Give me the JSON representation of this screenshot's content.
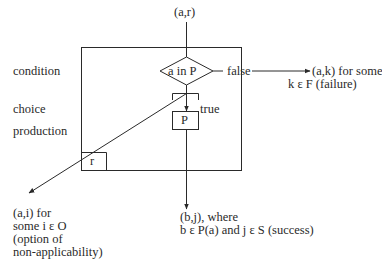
{
  "diagram": {
    "type": "flowchart",
    "input": "(a,r)",
    "row_labels": {
      "condition": "condition",
      "choice": "choice",
      "production": "production"
    },
    "condition_node": {
      "shape": "diamond",
      "label": "a in P"
    },
    "false_branch": {
      "edge_label": "false",
      "target_line1": "(a,k) for some",
      "target_line2": "k ε F (failure)"
    },
    "true_branch": {
      "edge_label": "true"
    },
    "production_node": {
      "shape": "box",
      "label": "P"
    },
    "rule_box": {
      "label": "r"
    },
    "success_output": {
      "line1": "(b,j), where",
      "line2": "b ε P(a) and j ε S (success)"
    },
    "non_applicability_output": {
      "line1": "(a,i) for",
      "line2": "some i ε O",
      "line3": "(option of",
      "line4": "non-applicability)"
    },
    "colors": {
      "ink": "#2a2a2a",
      "background": "#ffffff"
    }
  }
}
